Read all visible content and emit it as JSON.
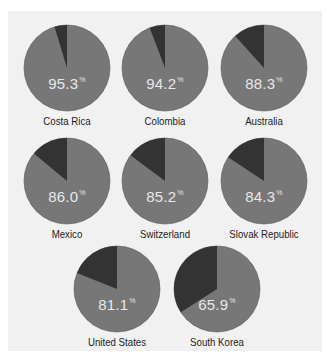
{
  "chart_data": {
    "type": "pie",
    "title": "",
    "unit": "%",
    "layout": "small multiples, 3-3-2 grid",
    "colors": {
      "primary_slice": "#777777",
      "remainder_slice": "#333333",
      "percent_text": "#e8e8e8",
      "label_text": "#1e1e1e",
      "panel_background": "#f1f1f1"
    },
    "pies": [
      {
        "country": "Costa Rica",
        "value": 95.3,
        "remainder": 4.7,
        "display": "95.3",
        "cx": 67,
        "cy": 68,
        "r": 43
      },
      {
        "country": "Colombia",
        "value": 94.2,
        "remainder": 5.8,
        "display": "94.2",
        "cx": 165,
        "cy": 68,
        "r": 43
      },
      {
        "country": "Australia",
        "value": 88.3,
        "remainder": 11.7,
        "display": "88.3",
        "cx": 264,
        "cy": 68,
        "r": 43
      },
      {
        "country": "Mexico",
        "value": 86.0,
        "remainder": 14.0,
        "display": "86.0",
        "cx": 67,
        "cy": 181,
        "r": 43
      },
      {
        "country": "Switzerland",
        "value": 85.2,
        "remainder": 14.8,
        "display": "85.2",
        "cx": 165,
        "cy": 181,
        "r": 43
      },
      {
        "country": "Slovak Republic",
        "value": 84.3,
        "remainder": 15.7,
        "display": "84.3",
        "cx": 264,
        "cy": 181,
        "r": 43
      },
      {
        "country": "United States",
        "value": 81.1,
        "remainder": 18.9,
        "display": "81.1",
        "cx": 117,
        "cy": 289,
        "r": 43
      },
      {
        "country": "South Korea",
        "value": 65.9,
        "remainder": 34.1,
        "display": "65.9",
        "cx": 217,
        "cy": 289,
        "r": 43
      }
    ]
  },
  "percent_sign": "%"
}
